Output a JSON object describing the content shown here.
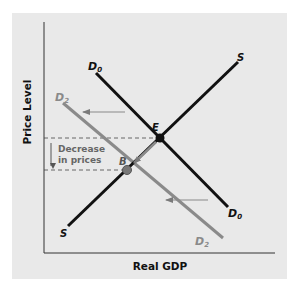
{
  "diagram": {
    "x_axis_label": "Real GDP",
    "y_axis_label": "Price Level",
    "curves": {
      "d0": {
        "label": "D",
        "subscript": "0",
        "color": "#111111"
      },
      "d2": {
        "label": "D",
        "subscript": "2",
        "color": "#8a8a8a"
      },
      "s_top": {
        "label": "S",
        "color": "#111111"
      },
      "s_bottom": {
        "label": "S",
        "color": "#111111"
      }
    },
    "points": {
      "e": {
        "label": "E"
      },
      "b": {
        "label": "B"
      }
    },
    "annotation": {
      "line1": "Decrease",
      "line2": "in prices"
    },
    "colors": {
      "background": "#e9e9e9",
      "black_line": "#111111",
      "gray_line": "#8a8a8a",
      "arrow": "#8a8a8a"
    }
  }
}
